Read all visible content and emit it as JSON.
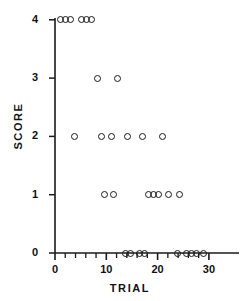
{
  "figure": {
    "caption_partial": ""
  },
  "chart_data": {
    "type": "scatter",
    "title": "",
    "xlabel": "TRIAL",
    "ylabel": "SCORE",
    "xlim": [
      0,
      30
    ],
    "ylim": [
      0,
      4
    ],
    "grid": false,
    "legend": null,
    "x_major_ticks": [
      0,
      10,
      20,
      30
    ],
    "x_major_tick_labels": [
      "0",
      "10",
      "20",
      "30"
    ],
    "x_minor_tick_step": 2,
    "y_major_ticks": [
      0,
      1,
      2,
      3,
      4
    ],
    "y_major_tick_labels": [
      "0",
      "1",
      "2",
      "3",
      "4"
    ],
    "marker": "open-circle",
    "marker_color": "#1a1a1a",
    "n_points": 30,
    "points": [
      {
        "x": 1.0,
        "y": 4
      },
      {
        "x": 2.0,
        "y": 4
      },
      {
        "x": 3.0,
        "y": 4
      },
      {
        "x": 5.2,
        "y": 4
      },
      {
        "x": 6.2,
        "y": 4
      },
      {
        "x": 7.2,
        "y": 4
      },
      {
        "x": 8.2,
        "y": 3
      },
      {
        "x": 12.2,
        "y": 3
      },
      {
        "x": 3.8,
        "y": 2
      },
      {
        "x": 9.0,
        "y": 2
      },
      {
        "x": 11.0,
        "y": 2
      },
      {
        "x": 14.2,
        "y": 2
      },
      {
        "x": 17.0,
        "y": 2
      },
      {
        "x": 21.0,
        "y": 2
      },
      {
        "x": 9.6,
        "y": 1
      },
      {
        "x": 11.4,
        "y": 1
      },
      {
        "x": 18.2,
        "y": 1
      },
      {
        "x": 19.2,
        "y": 1
      },
      {
        "x": 20.2,
        "y": 1
      },
      {
        "x": 22.2,
        "y": 1
      },
      {
        "x": 24.2,
        "y": 1
      },
      {
        "x": 13.8,
        "y": 0
      },
      {
        "x": 14.8,
        "y": 0
      },
      {
        "x": 16.4,
        "y": 0
      },
      {
        "x": 17.4,
        "y": 0
      },
      {
        "x": 23.8,
        "y": 0
      },
      {
        "x": 25.6,
        "y": 0
      },
      {
        "x": 26.6,
        "y": 0
      },
      {
        "x": 27.6,
        "y": 0
      },
      {
        "x": 29.0,
        "y": 0
      }
    ]
  },
  "geometry": {
    "origin_px_x": 55,
    "origin_px_y": 253,
    "px_per_x_unit": 5.13,
    "px_per_y_unit": 58.3
  }
}
